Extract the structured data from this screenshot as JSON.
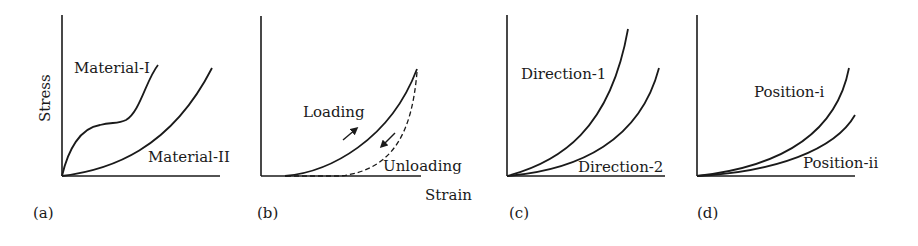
{
  "figure": {
    "y_axis_label": "Stress",
    "x_axis_label": "Strain",
    "panels": [
      {
        "id": "a",
        "label": "(a)",
        "curves": [
          "Material-I",
          "Material-II"
        ]
      },
      {
        "id": "b",
        "label": "(b)",
        "curves": [
          "Loading",
          "Unloading"
        ]
      },
      {
        "id": "c",
        "label": "(c)",
        "curves": [
          "Direction-1",
          "Direction-2"
        ]
      },
      {
        "id": "d",
        "label": "(d)",
        "curves": [
          "Position-i",
          "Position-ii"
        ]
      }
    ]
  },
  "colors": {
    "line": "#1a1a1a",
    "background": "#ffffff"
  }
}
